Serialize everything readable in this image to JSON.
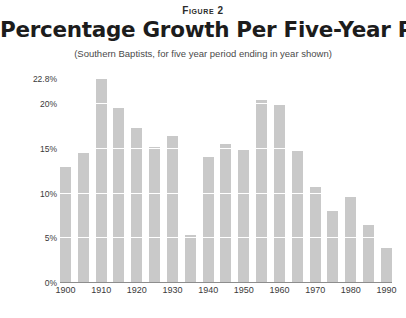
{
  "header": {
    "figure_label": "Figure 2",
    "title": "Percentage Growth Per Five-Year Period",
    "subtitle": "(Southern Baptists, for five year period ending in year shown)"
  },
  "colors": {
    "bar": "#c9c9c9",
    "background": "#ffffff",
    "text": "#2b2b2b",
    "axis": "#8d8d8d",
    "gridline": "#ffffff"
  },
  "chart_data": {
    "type": "bar",
    "title": "Percentage Growth Per Five-Year Period",
    "subtitle": "(Southern Baptists, for five year period ending in year shown)",
    "figure_label": "Figure 2",
    "xlabel": "",
    "ylabel": "",
    "ylim": [
      0,
      23.5
    ],
    "grid": true,
    "legend": "none",
    "y_tick_labels": [
      "22.8%",
      "20%",
      "15%",
      "10%",
      "5%",
      "0%"
    ],
    "y_tick_values": [
      22.8,
      20,
      15,
      10,
      5,
      0
    ],
    "x_tick_labels": [
      "1900",
      "1910",
      "1920",
      "1930",
      "1940",
      "1950",
      "1960",
      "1970",
      "1980",
      "1990"
    ],
    "x_tick_values": [
      1900,
      1910,
      1920,
      1930,
      1940,
      1950,
      1960,
      1970,
      1980,
      1990
    ],
    "categories": [
      "1900",
      "1905",
      "1910",
      "1915",
      "1920",
      "1925",
      "1930",
      "1935",
      "1940",
      "1945",
      "1950",
      "1955",
      "1960",
      "1965",
      "1970",
      "1975",
      "1980",
      "1985",
      "1990"
    ],
    "values": [
      12.9,
      14.4,
      22.8,
      19.5,
      17.2,
      15.1,
      16.3,
      5.3,
      14.0,
      15.5,
      14.8,
      20.4,
      19.8,
      14.7,
      10.6,
      7.9,
      9.5,
      6.4,
      3.8
    ]
  }
}
